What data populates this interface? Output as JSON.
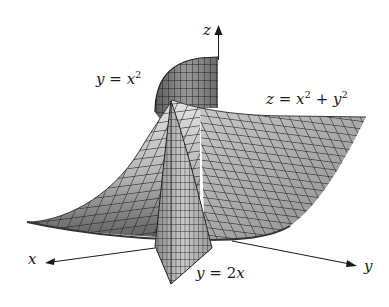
{
  "figure": {
    "type": "3d-surface-diagram",
    "axes": {
      "x": {
        "label": "x"
      },
      "y": {
        "label": "y"
      },
      "z": {
        "label": "z"
      }
    },
    "surfaces": [
      {
        "id": "paraboloid",
        "equation_label": {
          "lhs": "z",
          "eq": "=",
          "t1": "x",
          "e1": "2",
          "plus": "+",
          "t2": "y",
          "e2": "2"
        }
      },
      {
        "id": "parabolic-cylinder",
        "equation_label": {
          "lhs": "y",
          "eq": "=",
          "t1": "x",
          "e1": "2"
        }
      },
      {
        "id": "plane",
        "equation_label": {
          "lhs": "y",
          "eq": "=",
          "coef": "2",
          "var": "x"
        }
      }
    ],
    "colors": {
      "surface_light": "#d6d6d6",
      "surface_dark": "#6e6e6e",
      "mesh": "#2a2a2a",
      "axis": "#1a1a1a",
      "background": "#ffffff"
    }
  }
}
